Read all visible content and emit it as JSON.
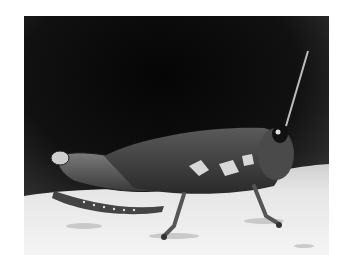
{
  "image": {
    "subject": "grasshopper",
    "alt": "Black and white close-up photograph of a grasshopper perched on a rock",
    "style": "grayscale",
    "colors": {
      "background_dark": "#0a0a0a",
      "rock_light": "#e8e8e8",
      "border": "#ffffff"
    }
  }
}
